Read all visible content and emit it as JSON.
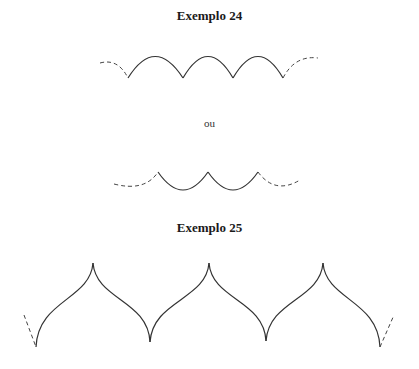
{
  "example24": {
    "title": "Exemplo 24",
    "separator": "ou",
    "variant_a": {
      "description": "arches opening downward, dashed ends",
      "arches": 3
    },
    "variant_b": {
      "description": "arches opening upward, dashed ends",
      "arches": 2
    }
  },
  "example25": {
    "title": "Exemplo 25",
    "description": "ogee arches with pointed peaks, dashed ends",
    "peaks": 3
  }
}
